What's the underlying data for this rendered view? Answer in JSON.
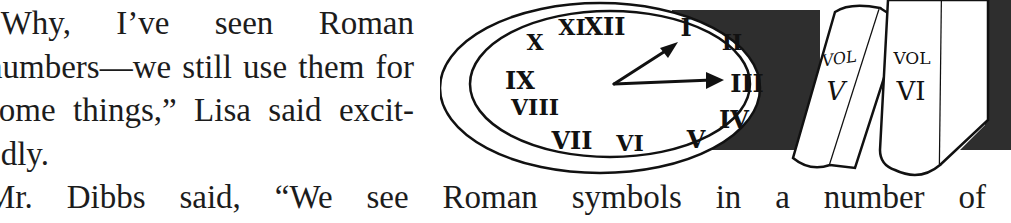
{
  "text": {
    "paragraph_1": {
      "lines": [
        "“Why, I’ve seen Roman",
        "numbers—we still use them for",
        "some things,” Lisa said excit-",
        "edly."
      ]
    },
    "paragraph_2": {
      "lines": [
        "Mr. Dibbs said, “We see Roman symbols in a number of"
      ]
    }
  },
  "illustration": {
    "description": "Oval clock with Roman numerals beside two books",
    "clock": {
      "numerals": [
        "XII",
        "I",
        "II",
        "III",
        "IV",
        "V",
        "VI",
        "VII",
        "VIII",
        "IX",
        "X",
        "XI"
      ],
      "hour_hand_points_to": "I",
      "minute_hand_points_to": "III"
    },
    "books": [
      {
        "label_top": "VOL",
        "label_bottom": "V"
      },
      {
        "label_top": "VOL",
        "label_bottom": "VI"
      }
    ],
    "colors": {
      "ink": "#111111",
      "shadow": "#2e2e2e",
      "paper": "#ffffff"
    }
  }
}
